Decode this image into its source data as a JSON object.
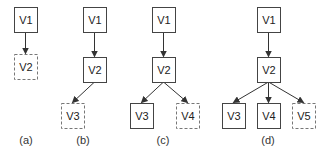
{
  "diagram": {
    "node_size": {
      "w": 23,
      "h": 25
    },
    "colors": {
      "solid_stroke": "#444444",
      "dashed_stroke": "#777777",
      "edge": "#333333"
    },
    "panels": [
      {
        "caption": "(a)",
        "caption_pos": {
          "x": 26,
          "y": 144
        },
        "nodes": [
          {
            "id": "V1",
            "label": "V1",
            "x": 14,
            "y": 7,
            "style": "solid"
          },
          {
            "id": "V2",
            "label": "V2",
            "x": 14,
            "y": 54,
            "style": "dashed"
          }
        ],
        "edges": [
          {
            "from": "V1",
            "to": "V2"
          }
        ]
      },
      {
        "caption": "(b)",
        "caption_pos": {
          "x": 83,
          "y": 144
        },
        "nodes": [
          {
            "id": "V1",
            "label": "V1",
            "x": 83,
            "y": 7,
            "style": "solid"
          },
          {
            "id": "V2",
            "label": "V2",
            "x": 83,
            "y": 57,
            "style": "solid"
          },
          {
            "id": "V3",
            "label": "V3",
            "x": 61,
            "y": 103,
            "style": "dashed"
          }
        ],
        "edges": [
          {
            "from": "V1",
            "to": "V2"
          },
          {
            "from": "V2",
            "to": "V3"
          }
        ]
      },
      {
        "caption": "(c)",
        "caption_pos": {
          "x": 163,
          "y": 144
        },
        "nodes": [
          {
            "id": "V1",
            "label": "V1",
            "x": 152,
            "y": 7,
            "style": "solid"
          },
          {
            "id": "V2",
            "label": "V2",
            "x": 152,
            "y": 57,
            "style": "solid"
          },
          {
            "id": "V3",
            "label": "V3",
            "x": 130,
            "y": 103,
            "style": "solid"
          },
          {
            "id": "V4",
            "label": "V4",
            "x": 176,
            "y": 103,
            "style": "dashed"
          }
        ],
        "edges": [
          {
            "from": "V1",
            "to": "V2"
          },
          {
            "from": "V2",
            "to": "V3"
          },
          {
            "from": "V2",
            "to": "V4"
          }
        ]
      },
      {
        "caption": "(d)",
        "caption_pos": {
          "x": 268,
          "y": 144
        },
        "nodes": [
          {
            "id": "V1",
            "label": "V1",
            "x": 257,
            "y": 7,
            "style": "solid"
          },
          {
            "id": "V2",
            "label": "V2",
            "x": 257,
            "y": 57,
            "style": "solid"
          },
          {
            "id": "V3",
            "label": "V3",
            "x": 222,
            "y": 103,
            "style": "solid"
          },
          {
            "id": "V4",
            "label": "V4",
            "x": 257,
            "y": 103,
            "style": "solid"
          },
          {
            "id": "V5",
            "label": "V5",
            "x": 292,
            "y": 103,
            "style": "dashed"
          }
        ],
        "edges": [
          {
            "from": "V1",
            "to": "V2"
          },
          {
            "from": "V2",
            "to": "V3"
          },
          {
            "from": "V2",
            "to": "V4"
          },
          {
            "from": "V2",
            "to": "V5"
          }
        ]
      }
    ]
  }
}
